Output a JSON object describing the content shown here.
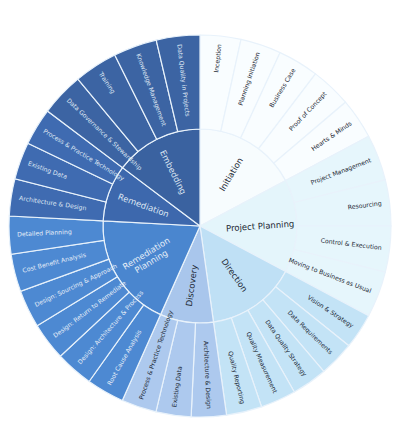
{
  "diagram": {
    "type": "sunburst",
    "center": [
      200,
      226
    ],
    "inner_radius": 0,
    "mid_radius": 97,
    "outer_radius": 191,
    "phases": [
      {
        "label": "Initiation",
        "start": 0,
        "end": 62,
        "color": "#f7fcfe",
        "outer_color": "#f9fdff",
        "text_color": "#1e2a36",
        "children": [
          {
            "label": "Inception"
          },
          {
            "label": "Planning Initiation"
          },
          {
            "label": "Business Case"
          },
          {
            "label": "Proof of Concept"
          },
          {
            "label": "Hearts & Minds"
          }
        ]
      },
      {
        "label": "Project Planning",
        "start": 62,
        "end": 118,
        "color": "#e4f5fb",
        "outer_color": "#e6f6fc",
        "text_color": "#1e2a36",
        "children": [
          {
            "label": "Project Management"
          },
          {
            "label": "Resourcing"
          },
          {
            "label": "Control & Execution"
          },
          {
            "label": "Moving to Business as Usual"
          }
        ]
      },
      {
        "label": "Direction",
        "start": 118,
        "end": 172,
        "color": "#bfe0f5",
        "outer_color": "#c3e3f6",
        "text_color": "#1e2a36",
        "children": [
          {
            "label": "Vision & Strategy"
          },
          {
            "label": "Data Requirements"
          },
          {
            "label": "Data Quality Strategy"
          },
          {
            "label": "Quality Measurement"
          },
          {
            "label": "Quality Reporting"
          }
        ]
      },
      {
        "label": "Discovery",
        "start": 172,
        "end": 204,
        "color": "#a9c6ec",
        "outer_color": "#adc9ee",
        "text_color": "#1e2a36",
        "children": [
          {
            "label": "Architecture & Design"
          },
          {
            "label": "Existing Data"
          },
          {
            "label": "Process & Practice Technology"
          }
        ]
      },
      {
        "label": "Remediation Planning",
        "start": 204,
        "end": 273,
        "color": "#4a86cf",
        "outer_color": "#4d89d2",
        "text_color": "#e6eef8",
        "children": [
          {
            "label": "Root Cause Analysis"
          },
          {
            "label": "Design: Architecture & Process"
          },
          {
            "label": "Design: Return to Remediate"
          },
          {
            "label": "Design: Sourcing & Approach"
          },
          {
            "label": "Cost Benefit Analysis"
          },
          {
            "label": "Detailed Planning"
          }
        ]
      },
      {
        "label": "Remediation",
        "start": 273,
        "end": 307,
        "color": "#3d68ad",
        "outer_color": "#3f6bb1",
        "text_color": "#dfe7f3",
        "children": [
          {
            "label": "Architecture & Design"
          },
          {
            "label": "Existing Data"
          },
          {
            "label": "Process & Practice Technology"
          }
        ]
      },
      {
        "label": "Embedding",
        "start": 307,
        "end": 360,
        "color": "#3a62a0",
        "outer_color": "#3c64a3",
        "text_color": "#dfe7f3",
        "children": [
          {
            "label": "Data Governance & Stewardship"
          },
          {
            "label": "Training"
          },
          {
            "label": "Knowledge Management"
          },
          {
            "label": "Data Quality in Projects"
          }
        ]
      }
    ]
  }
}
